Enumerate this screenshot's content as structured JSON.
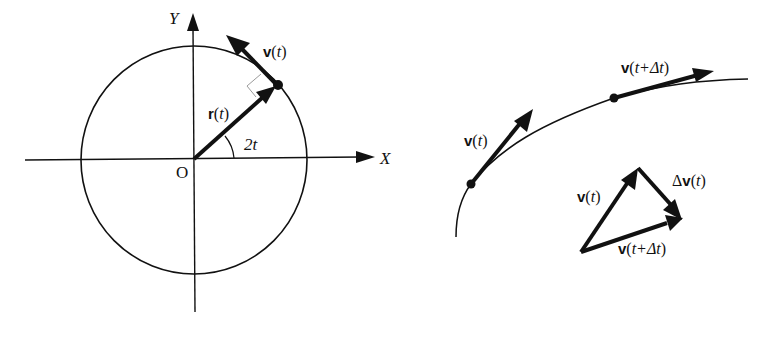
{
  "left_diagram": {
    "axis_x_label": "X",
    "axis_y_label": "Y",
    "origin_label": "O",
    "angle_label": "2t",
    "position_vector": {
      "symbol": "r",
      "arg": "t"
    },
    "velocity_vector": {
      "symbol": "v",
      "arg": "t"
    },
    "right_angle_marker": true
  },
  "right_diagram": {
    "curve_velocity_1": {
      "symbol": "v",
      "arg": "t"
    },
    "curve_velocity_2": {
      "symbol": "v",
      "arg": "t+Δt"
    },
    "triangle": {
      "side_a": {
        "symbol": "v",
        "arg": "t"
      },
      "side_b": {
        "symbol": "v",
        "arg": "t+Δt"
      },
      "side_c": {
        "prefix": "Δ",
        "symbol": "v",
        "arg": "t"
      }
    }
  },
  "colors": {
    "ink": "#111111",
    "background": "#ffffff",
    "right_angle_marker": "#9a9a9a"
  }
}
